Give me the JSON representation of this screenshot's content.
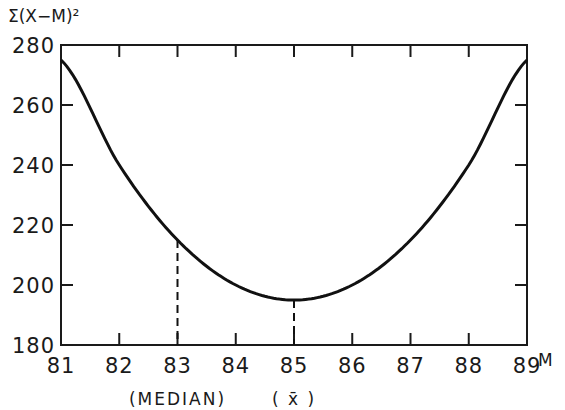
{
  "chart_data": {
    "type": "line",
    "title": "",
    "xlabel": "M",
    "ylabel": "Σ(X−M)²",
    "x": [
      81,
      82,
      83,
      84,
      85,
      86,
      87,
      88,
      89
    ],
    "series": [
      {
        "name": "Σ(X−M)²",
        "values": [
          275,
          240,
          215,
          200,
          195,
          200,
          215,
          240,
          275
        ]
      }
    ],
    "xlim": [
      81,
      89
    ],
    "ylim": [
      180,
      280
    ],
    "x_ticks": [
      "81",
      "82",
      "83",
      "84",
      "85",
      "86",
      "87",
      "88",
      "89"
    ],
    "y_ticks": [
      "180",
      "200",
      "220",
      "240",
      "260",
      "280"
    ],
    "grid": false,
    "legend": "none",
    "annotations": [
      {
        "x": 83,
        "y": 215,
        "label": "(MEDIAN)",
        "style": "dashed-vertical"
      },
      {
        "x": 85,
        "y": 195,
        "label": "( x̄ )",
        "style": "dashed-vertical"
      }
    ],
    "colors": {
      "line": "#111111",
      "axis": "#1a1a1a",
      "background": "#ffffff"
    }
  }
}
